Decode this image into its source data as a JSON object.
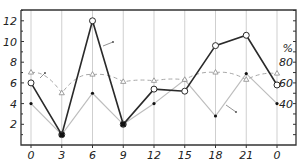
{
  "chart_data": {
    "type": "line",
    "title": "",
    "xlabel": "",
    "ylabel": "",
    "y2label": "%",
    "categories": [
      "0",
      "3",
      "6",
      "9",
      "12",
      "15",
      "18",
      "21",
      "0"
    ],
    "ylim": [
      0,
      13
    ],
    "y2lim": [
      0,
      130
    ],
    "yticks": [
      2,
      4,
      6,
      8,
      10,
      12
    ],
    "y2ticks": [
      40,
      60,
      80
    ],
    "grid": "vertical lines at each x tick",
    "legend": "none (lines marked by small arrow annotations)",
    "series": [
      {
        "name": "open-circle series",
        "marker": "open-circle",
        "line": "solid-dark",
        "axis": "left",
        "values": [
          6.0,
          1.0,
          12.0,
          2.0,
          5.4,
          5.2,
          9.6,
          10.6,
          5.8
        ]
      },
      {
        "name": "filled-dot series",
        "marker": "filled-dot",
        "line": "solid-light",
        "axis": "left",
        "values": [
          4.0,
          1.0,
          5.0,
          2.0,
          4.0,
          6.3,
          2.8,
          6.9,
          4.0
        ]
      },
      {
        "name": "triangle series",
        "marker": "triangle",
        "line": "dashed-light",
        "axis": "right",
        "values": [
          70,
          50,
          68,
          61,
          62,
          63,
          70,
          63,
          69
        ]
      }
    ]
  },
  "colors": {
    "dark_line": "#2a2a2a",
    "light_line": "#bdbdbd",
    "dashed_line": "#a8a8a8",
    "frame": "#333333",
    "grid": "#cfcfcf"
  }
}
